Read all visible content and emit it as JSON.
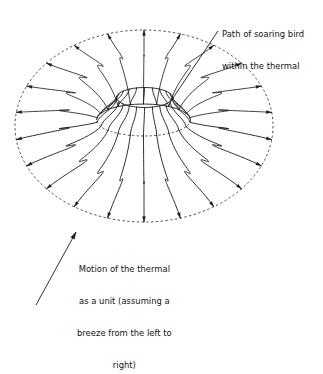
{
  "figure": {
    "background_color": "#ffffff",
    "stroke_color": "#1a1a1a",
    "dashed_color": "#3a3a3a"
  },
  "annotations": {
    "bird_path": {
      "name": "Path of soaring bird within the thermal",
      "lines": [
        "Path of soaring bird",
        "within the thermal"
      ],
      "leader": {
        "x1": 218.0,
        "y1": 31.0,
        "x2": 171.0,
        "y2": 101.0,
        "arrowhead": false
      }
    },
    "thermal_motion": {
      "name": "Motion of the thermal as a unit",
      "lines": [
        "Motion of the thermal",
        "as a unit (assuming a",
        "breeze from the left to",
        "right)"
      ],
      "leader": {
        "x1": 36.0,
        "y1": 305.0,
        "x2": 76.0,
        "y2": 232.0,
        "arrowhead": true
      }
    }
  },
  "geometry": {
    "outer_boundary": {
      "shape": "ellipse",
      "cx": 144.0,
      "cy": 126.0,
      "rx": 129.0,
      "ry": 96.0,
      "style": "dashed",
      "dash": "2.4 2.4"
    },
    "inner_ridge": {
      "shape": "ellipse",
      "cx": 143.5,
      "cy": 120.0,
      "rx": 47.0,
      "ry": 16.0,
      "style": "mixed-solid-top-dashed-bottom",
      "dash": "2.2 2.2"
    },
    "hole_rim": {
      "shape": "ellipse",
      "cx": 144.5,
      "cy": 97.5,
      "rx": 28.0,
      "ry": 10.0,
      "style": "solid"
    },
    "flow_lines": {
      "count": 22,
      "description": "Meridian streamlines rising through the central hole, arching over the torus top and descending to the outer boundary where each ends in an arrowhead",
      "arrowhead_length": 5.4,
      "arrowhead_width": 3.0,
      "stroke_width": 0.9,
      "start_angle_deg": -90,
      "hole_attach": {
        "cx": 144.5,
        "cy": 97.5,
        "rx": 28.0,
        "ry": 10.0
      },
      "ridge_attach": {
        "cx": 143.5,
        "cy": 120.0,
        "rx": 47.0,
        "ry": 16.0
      },
      "outer_attach": {
        "cx": 144.0,
        "cy": 126.0,
        "rx": 129.0,
        "ry": 96.0
      },
      "crest_scale": 0.62,
      "crest_lift": 7.0
    }
  }
}
